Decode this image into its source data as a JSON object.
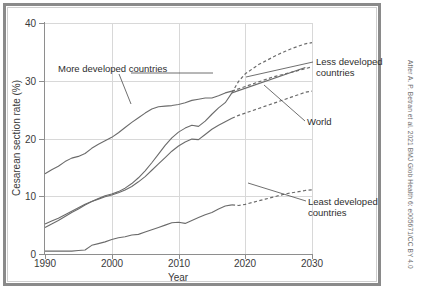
{
  "figure": {
    "credit": "After A. P. Betran et al. 2021 BMJ Glob Health 6: e005671/CC BY 4.0"
  },
  "annotations": {
    "more_developed": "More developed countries",
    "less_developed_l1": "Less developed",
    "less_developed_l2": "countries",
    "world": "World",
    "least_developed_l1": "Least developed",
    "least_developed_l2": "countries"
  },
  "chart_data": {
    "type": "line",
    "title": "",
    "subtitle": "",
    "xlabel": "Year",
    "ylabel": "Cesarean section rate (%)",
    "xlim": [
      1990,
      2030
    ],
    "ylim": [
      0,
      40
    ],
    "xticks": [
      1990,
      2000,
      2010,
      2020,
      2030
    ],
    "xticklabels": [
      "1990",
      "2000",
      "2010",
      "2020",
      "2030"
    ],
    "yticks": [
      0,
      10,
      20,
      30,
      40
    ],
    "yticklabels": [
      "0",
      "10",
      "20",
      "30",
      "40"
    ],
    "grid": true,
    "grid_axis": "both",
    "legend": "none (direct labels with leader lines)",
    "line_color": "#6b6b6b",
    "projection_note": "Dashed segments from 2018 onward are projections",
    "series": [
      {
        "name": "More developed countries",
        "label_position": "upper-left with leader line to curve near 2004",
        "observed_style": "solid",
        "projected_style": "dashed",
        "projection_start_year": 2018,
        "x": [
          1990,
          1991,
          1992,
          1993,
          1994,
          1995,
          1996,
          1997,
          1998,
          1999,
          2000,
          2001,
          2002,
          2003,
          2004,
          2005,
          2006,
          2007,
          2008,
          2009,
          2010,
          2011,
          2012,
          2013,
          2014,
          2015,
          2016,
          2017,
          2018,
          2019,
          2020,
          2021,
          2022,
          2023,
          2024,
          2025,
          2026,
          2027,
          2028,
          2029,
          2030
        ],
        "y": [
          13.9,
          14.6,
          15.2,
          16.0,
          16.6,
          16.9,
          17.4,
          18.3,
          19.0,
          19.6,
          20.2,
          21.0,
          21.9,
          22.8,
          23.6,
          24.4,
          25.1,
          25.5,
          25.6,
          25.7,
          25.9,
          26.2,
          26.6,
          26.8,
          27.0,
          27.0,
          27.4,
          27.9,
          28.2,
          28.6,
          29.0,
          29.4,
          29.8,
          30.2,
          30.6,
          30.9,
          31.2,
          31.5,
          31.8,
          32.1,
          32.4
        ]
      },
      {
        "name": "Less developed countries",
        "label_position": "right of plot, two lines, leader line to 2029 endpoint",
        "observed_style": "solid",
        "projected_style": "dashed",
        "projection_start_year": 2018,
        "x": [
          1990,
          1991,
          1992,
          1993,
          1994,
          1995,
          1996,
          1997,
          1998,
          1999,
          2000,
          2001,
          2002,
          2003,
          2004,
          2005,
          2006,
          2007,
          2008,
          2009,
          2010,
          2011,
          2012,
          2013,
          2014,
          2015,
          2016,
          2017,
          2018,
          2019,
          2020,
          2021,
          2022,
          2023,
          2024,
          2025,
          2026,
          2027,
          2028,
          2029,
          2030
        ],
        "y": [
          4.6,
          5.2,
          5.8,
          6.5,
          7.2,
          7.8,
          8.5,
          9.1,
          9.6,
          10.1,
          10.4,
          10.8,
          11.4,
          12.2,
          13.2,
          14.4,
          15.8,
          17.3,
          18.8,
          20.1,
          21.1,
          21.8,
          22.3,
          22.1,
          23.0,
          24.2,
          25.3,
          26.2,
          27.9,
          29.9,
          31.2,
          32.0,
          32.8,
          33.4,
          34.0,
          34.6,
          35.1,
          35.6,
          36.0,
          36.4,
          36.6
        ]
      },
      {
        "name": "World",
        "label_position": "right of plot, leader line to 2029 endpoint",
        "observed_style": "solid",
        "projected_style": "dashed",
        "projection_start_year": 2018,
        "x": [
          1990,
          1991,
          1992,
          1993,
          1994,
          1995,
          1996,
          1997,
          1998,
          1999,
          2000,
          2001,
          2002,
          2003,
          2004,
          2005,
          2006,
          2007,
          2008,
          2009,
          2010,
          2011,
          2012,
          2013,
          2014,
          2015,
          2016,
          2017,
          2018,
          2019,
          2020,
          2021,
          2022,
          2023,
          2024,
          2025,
          2026,
          2027,
          2028,
          2029,
          2030
        ],
        "y": [
          5.2,
          5.7,
          6.2,
          6.8,
          7.4,
          8.0,
          8.6,
          9.1,
          9.5,
          9.9,
          10.2,
          10.6,
          11.1,
          11.7,
          12.5,
          13.4,
          14.5,
          15.6,
          16.7,
          17.8,
          18.7,
          19.4,
          19.9,
          19.8,
          20.7,
          21.6,
          22.3,
          22.9,
          23.5,
          24.0,
          24.4,
          24.8,
          25.2,
          25.6,
          26.0,
          26.4,
          26.8,
          27.2,
          27.6,
          28.0,
          28.2
        ]
      },
      {
        "name": "Least developed countries",
        "label_position": "lower-right, two lines, leader line to curve near 2023",
        "observed_style": "solid",
        "projected_style": "dashed",
        "projection_start_year": 2018,
        "x": [
          1990,
          1991,
          1992,
          1993,
          1994,
          1995,
          1996,
          1997,
          1998,
          1999,
          2000,
          2001,
          2002,
          2003,
          2004,
          2005,
          2006,
          2007,
          2008,
          2009,
          2010,
          2011,
          2012,
          2013,
          2014,
          2015,
          2016,
          2017,
          2018,
          2019,
          2020,
          2021,
          2022,
          2023,
          2024,
          2025,
          2026,
          2027,
          2028,
          2029,
          2030
        ],
        "y": [
          0.5,
          0.5,
          0.5,
          0.5,
          0.5,
          0.6,
          0.7,
          1.5,
          1.8,
          2.1,
          2.5,
          2.8,
          3.0,
          3.3,
          3.4,
          3.8,
          4.2,
          4.6,
          5.0,
          5.4,
          5.5,
          5.3,
          5.8,
          6.3,
          6.8,
          7.2,
          7.8,
          8.3,
          8.5,
          8.4,
          8.6,
          8.9,
          9.2,
          9.5,
          9.8,
          10.1,
          10.4,
          10.6,
          10.8,
          11.0,
          11.1
        ]
      }
    ]
  }
}
